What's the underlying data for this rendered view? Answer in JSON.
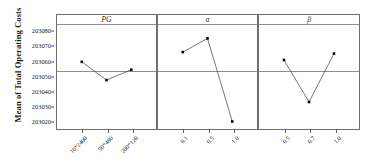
{
  "chart_data": {
    "type": "line",
    "title": "",
    "ylabel": "Mean of Total Operating Costs",
    "xlabel": "",
    "ylim": [
      203015,
      203084
    ],
    "yticks": [
      203020,
      203030,
      203040,
      203050,
      203060,
      203070,
      203080
    ],
    "ytick_labels": [
      "203020",
      "203030",
      "203040",
      "203050",
      "203060",
      "203070",
      "203080"
    ],
    "grid": false,
    "reference_line": 203054,
    "legend": "none",
    "panels": [
      {
        "name": "PG",
        "label": "PG",
        "categories": [
          "10*2400",
          "50*480",
          "200*120"
        ],
        "values": [
          203059.8,
          203047.8,
          203054.6
        ]
      },
      {
        "name": "alpha",
        "label": "α",
        "categories": [
          "0.1",
          "0.5",
          "1.0"
        ],
        "values": [
          203066.2,
          203075.2,
          203020.6
        ]
      },
      {
        "name": "beta",
        "label": "β",
        "categories": [
          "0.5",
          "0.7",
          "1.0"
        ],
        "values": [
          203061.0,
          203033.4,
          203065.2
        ]
      }
    ],
    "marker": {
      "shape": "square",
      "color": "#000000",
      "size": 2.6
    },
    "line": {
      "color": "#3a3a3a",
      "width": 0.7
    }
  }
}
